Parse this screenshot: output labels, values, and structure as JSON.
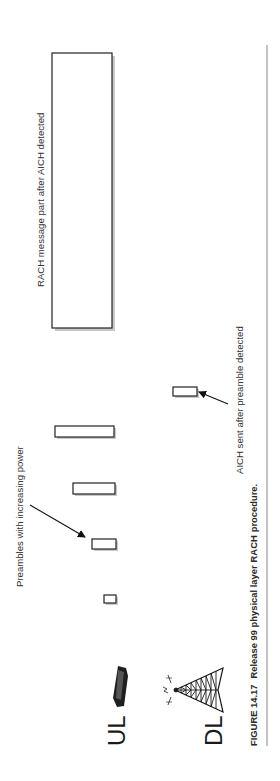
{
  "figure": {
    "orientation": "rotated-90-ccw",
    "caption_label": "FIGURE 14.17",
    "caption_text": "Release 99 physical layer",
    "caption_bold": "RACH",
    "caption_end": "procedure.",
    "caption_full": "FIGURE 14.17  Release 99 physical layer RACH procedure."
  },
  "lanes": {
    "uplink": {
      "label": "UL",
      "icon": "mobile-phone-icon"
    },
    "downlink": {
      "label": "DL",
      "icon": "base-station-tower-icon"
    }
  },
  "annotations": {
    "preambles": "Preambles with increasing power",
    "aich": "AICH sent after preamble detected",
    "rach_message": "RACH message part after AICH detected"
  },
  "blocks": {
    "preambles": [
      {
        "name": "preamble-1",
        "power_rank": 1
      },
      {
        "name": "preamble-2",
        "power_rank": 2
      },
      {
        "name": "preamble-3",
        "power_rank": 3
      },
      {
        "name": "preamble-4",
        "power_rank": 4
      }
    ],
    "aich": {
      "name": "aich-burst",
      "channel": "DL"
    },
    "rach_message": {
      "name": "rach-message-part",
      "channel": "UL"
    }
  },
  "colors": {
    "stroke": "#222222",
    "text": "#333333",
    "divider": "#888888",
    "background": "#ffffff"
  }
}
